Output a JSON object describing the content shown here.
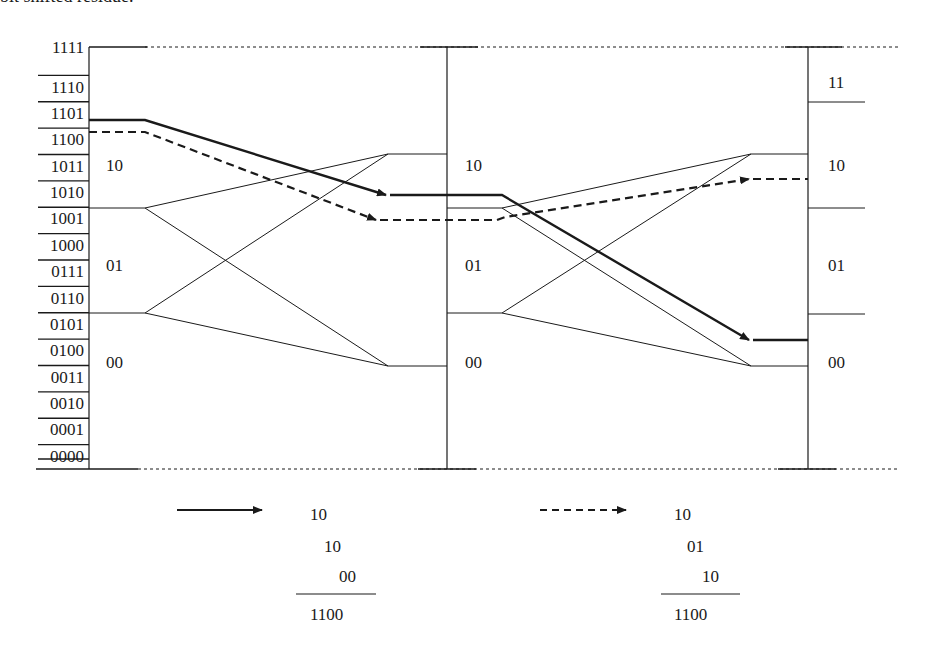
{
  "caption": "bit shifted residue.",
  "axis_codes": [
    "1111",
    "1110",
    "1101",
    "1100",
    "1011",
    "1010",
    "1001",
    "1000",
    "0111",
    "0110",
    "0101",
    "0100",
    "0011",
    "0010",
    "0001",
    "0000"
  ],
  "stage1": {
    "region_labels": [
      {
        "text": "10",
        "x": 106,
        "y": 170
      },
      {
        "text": "01",
        "x": 106,
        "y": 270
      },
      {
        "text": "00",
        "x": 106,
        "y": 367
      }
    ]
  },
  "stage2": {
    "region_labels": [
      {
        "text": "10",
        "x": 465,
        "y": 170
      },
      {
        "text": "01",
        "x": 465,
        "y": 270
      },
      {
        "text": "00",
        "x": 465,
        "y": 367
      }
    ]
  },
  "stage3": {
    "region_labels": [
      {
        "text": "11",
        "x": 828,
        "y": 87
      },
      {
        "text": "10",
        "x": 828,
        "y": 170
      },
      {
        "text": "01",
        "x": 828,
        "y": 270
      },
      {
        "text": "00",
        "x": 828,
        "y": 367
      }
    ]
  },
  "legend": {
    "solid": {
      "style": "solid-arrow",
      "digits": [
        "10",
        "10",
        "00"
      ],
      "sum": "1100"
    },
    "dashed": {
      "style": "dashed-arrow",
      "digits": [
        "10",
        "01",
        "10"
      ],
      "sum": "1100"
    }
  },
  "colors": {
    "ink": "#1a1a1a",
    "background": "#ffffff"
  }
}
